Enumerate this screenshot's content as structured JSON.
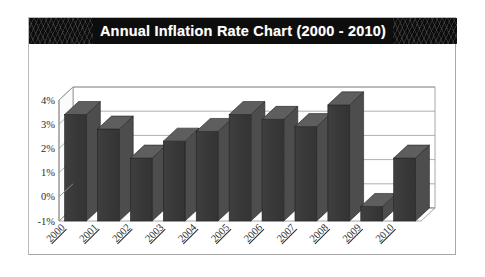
{
  "chart_data": {
    "type": "bar",
    "title": "Annual Inflation Rate Chart (2000 - 2010)",
    "xlabel": "",
    "ylabel": "",
    "categories": [
      "2000",
      "2001",
      "2002",
      "2003",
      "2004",
      "2005",
      "2006",
      "2007",
      "2008",
      "2009",
      "2010"
    ],
    "values": [
      3.4,
      2.8,
      1.6,
      2.3,
      2.7,
      3.4,
      3.2,
      2.9,
      3.8,
      -0.4,
      1.6
    ],
    "ylim": [
      -1,
      4
    ],
    "ytick_values": [
      4,
      3,
      2,
      1,
      0,
      -1
    ],
    "ytick_labels": [
      "4%",
      "3%",
      "2%",
      "1%",
      "0%",
      "-1%"
    ],
    "grid": true,
    "legend": false,
    "style": "3d-column",
    "series_name": "Annual Inflation Rate"
  },
  "colors": {
    "banner_background": "#0d0d0d",
    "banner_text": "#ffffff",
    "bar_front": "#3a3a3a",
    "bar_side": "#4d4d4d",
    "bar_top": "#5e5e5e",
    "plot_background": "#ffffff",
    "gridline": "#9a9a9a",
    "axis_line": "#8a8a8a",
    "card_border": "#b9b9b9",
    "tick_text": "#2b2b2b"
  }
}
